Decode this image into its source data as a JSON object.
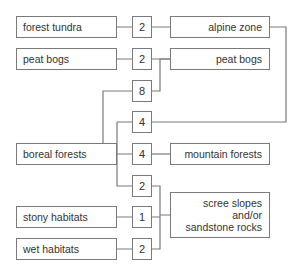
{
  "left_nodes": [
    {
      "label": "forest tundra"
    },
    {
      "label": "peat bogs"
    },
    {
      "label": "boreal forests"
    },
    {
      "label": "stony habitats"
    },
    {
      "label": "wet habitats"
    }
  ],
  "count_nodes": [
    {
      "value": "2"
    },
    {
      "value": "2"
    },
    {
      "value": "8"
    },
    {
      "value": "4"
    },
    {
      "value": "4"
    },
    {
      "value": "2"
    },
    {
      "value": "1"
    },
    {
      "value": "2"
    }
  ],
  "right_nodes": [
    {
      "label": "alpine zone"
    },
    {
      "label": "peat bogs"
    },
    {
      "label": "mountain forests"
    },
    {
      "label_lines": [
        "scree slopes",
        "and/or",
        "sandstone rocks"
      ]
    }
  ],
  "colors": {
    "line": "#7a7a7a",
    "text": "#333333",
    "background": "#ffffff"
  }
}
